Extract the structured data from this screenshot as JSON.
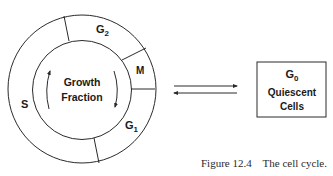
{
  "diagram": {
    "title": "The cell cycle",
    "cycle": {
      "center_label_line1": "Growth",
      "center_label_line2": "Fraction",
      "phases": [
        {
          "id": "G2",
          "base": "G",
          "sub": "2"
        },
        {
          "id": "M",
          "base": "M",
          "sub": ""
        },
        {
          "id": "G1",
          "base": "G",
          "sub": "1"
        },
        {
          "id": "S",
          "base": "S",
          "sub": ""
        }
      ]
    },
    "exchange_arrows": {
      "top_direction": "right",
      "bottom_direction": "left"
    },
    "quiescent_box": {
      "phase_base": "G",
      "phase_sub": "0",
      "line2": "Quiescent",
      "line3": "Cells"
    },
    "caption": {
      "figure_label": "Figure 12.4",
      "text": "The cell cycle."
    },
    "colors": {
      "stroke": "#2a2a2a",
      "text": "#1a1a1a",
      "background": "#ffffff"
    }
  }
}
